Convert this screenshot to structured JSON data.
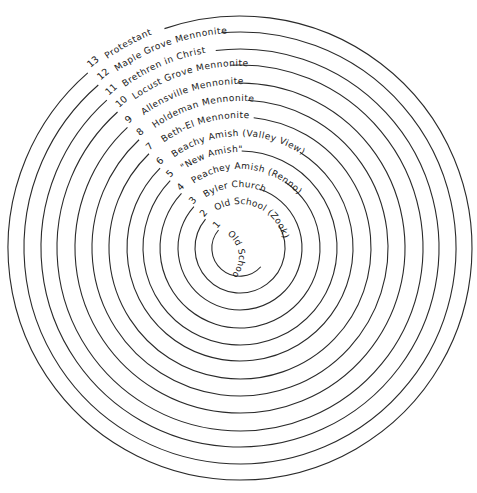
{
  "diagram": {
    "type": "concentric-circles",
    "center": [
      240,
      248
    ],
    "stroke_color": "#2a2a2a",
    "rings": [
      {
        "number": "1",
        "label": "Old School (Yoder)",
        "radius": 28,
        "start_deg": -140,
        "end_deg": 42
      },
      {
        "number": "2",
        "label": "Old School (Zook)",
        "radius": 45,
        "start_deg": -140,
        "end_deg": -30
      },
      {
        "number": "3",
        "label": "Byler Church",
        "radius": 62,
        "start_deg": -138,
        "end_deg": -72
      },
      {
        "number": "4",
        "label": "Peachey Amish (Renno)",
        "radius": 80,
        "start_deg": -137,
        "end_deg": -56
      },
      {
        "number": "5",
        "label": "\"New Amish\"",
        "radius": 97,
        "start_deg": -136,
        "end_deg": -89
      },
      {
        "number": "6",
        "label": "Beachy Amish (Valley View)",
        "radius": 113,
        "start_deg": -135,
        "end_deg": -58
      },
      {
        "number": "7",
        "label": "Beth-El Mennonite",
        "radius": 131,
        "start_deg": -134,
        "end_deg": -84
      },
      {
        "number": "8",
        "label": "Holdeman Mennonite",
        "radius": 148,
        "start_deg": -133,
        "end_deg": -87
      },
      {
        "number": "9",
        "label": "Allensville Mennonite",
        "radius": 165,
        "start_deg": -133,
        "end_deg": -91
      },
      {
        "number": "10",
        "label": "Locust Grove Mennonite",
        "radius": 183,
        "start_deg": -132,
        "end_deg": -93
      },
      {
        "number": "11",
        "label": "Brethren in Christ",
        "radius": 199,
        "start_deg": -132,
        "end_deg": -97
      },
      {
        "number": "12",
        "label": "Maple Grove Mennonite",
        "radius": 216,
        "start_deg": -131,
        "end_deg": -95
      },
      {
        "number": "13",
        "label": "Protestant",
        "radius": 232,
        "start_deg": -131,
        "end_deg": -109
      }
    ]
  }
}
